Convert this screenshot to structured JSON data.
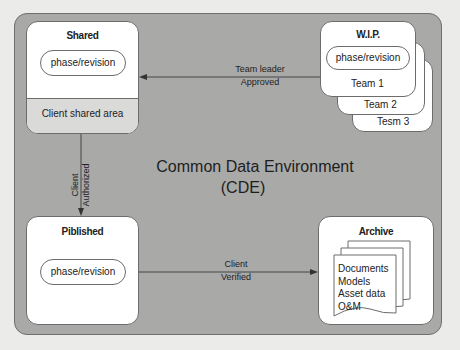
{
  "diagram": {
    "title_line1": "Common Data Environment",
    "title_line2": "(CDE)",
    "colors": {
      "page_background": "#ebebea",
      "cde_background": "#a9a9a8",
      "box_fill": "#ffffff",
      "client_shared_fill": "#dadad9",
      "stroke": "#6c6c6c"
    },
    "boxes": {
      "shared": {
        "title": "Shared",
        "pill": "phase/revision",
        "sub_area": "Client shared area"
      },
      "wip": {
        "title": "W.I.P.",
        "pill": "phase/revision",
        "teams": [
          "Team 1",
          "Team 2",
          "Tesm 3"
        ]
      },
      "published": {
        "title": "Piblished",
        "pill": "phase/revision"
      },
      "archive": {
        "title": "Archive",
        "items": [
          "Documents",
          "Models",
          "Asset data",
          "O&M"
        ]
      }
    },
    "arrows": {
      "wip_to_shared": {
        "line1": "Team leader",
        "line2": "Approved"
      },
      "shared_to_published": {
        "line1": "Client",
        "line2": "Authorized"
      },
      "published_to_archive": {
        "line1": "Client",
        "line2": "Verified"
      }
    }
  }
}
